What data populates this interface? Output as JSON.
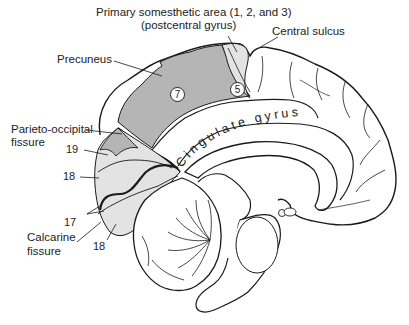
{
  "figure": {
    "labels": {
      "primary_somesthetic_line1": "Primary somesthetic area (1, 2, and 3)",
      "primary_somesthetic_line2": "(postcentral gyrus)",
      "central_sulcus": "Central sulcus",
      "precuneus": "Precuneus",
      "parieto_occipital_line1": "Parieto-occipital",
      "parieto_occipital_line2": "fissure",
      "calcarine_line1": "Calcarine",
      "calcarine_line2": "fissure",
      "cingulate_gyrus": "Cingulate gyrus"
    },
    "area_numbers": {
      "area_19": "19",
      "area_18_upper": "18",
      "area_17": "17",
      "area_18_lower": "18",
      "area_7": "7",
      "area_5": "5"
    },
    "colors": {
      "outline": "#1a1a1a",
      "precuneus_fill": "#b5b5b5",
      "light_fill": "#e3e3e3",
      "background": "#ffffff"
    }
  }
}
